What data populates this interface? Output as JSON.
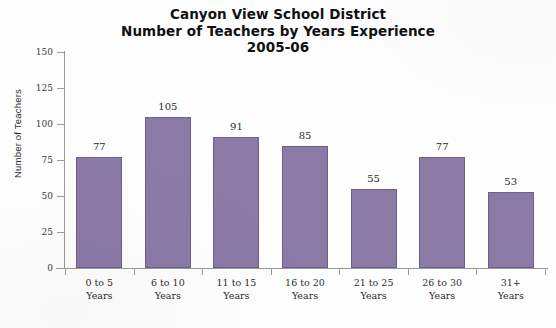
{
  "chart_data": {
    "type": "bar",
    "title": "Canyon View School District\nNumber of Teachers by Years Experience\n2005-06",
    "title_lines": [
      "Canyon View School District",
      "Number of Teachers by Years Experience",
      "2005-06"
    ],
    "categories": [
      "0 to 5 Years",
      "6 to 10 Years",
      "11 to 15 Years",
      "16 to 20 Years",
      "21 to 25 Years",
      "26 to 30 Years",
      "31+ Years"
    ],
    "category_lines": [
      [
        "0 to 5",
        "Years"
      ],
      [
        "6 to 10",
        "Years"
      ],
      [
        "11 to 15",
        "Years"
      ],
      [
        "16 to 20",
        "Years"
      ],
      [
        "21 to 25",
        "Years"
      ],
      [
        "26 to 30",
        "Years"
      ],
      [
        "31+",
        "Years"
      ]
    ],
    "values": [
      77,
      105,
      91,
      85,
      55,
      77,
      53
    ],
    "value_labels": [
      "77",
      "105",
      "91",
      "85",
      "55",
      "77",
      "53"
    ],
    "xlabel": "",
    "ylabel": "Number of Teachers",
    "ylim": [
      0,
      150
    ],
    "ytick_values": [
      0,
      25,
      50,
      75,
      100,
      125,
      150
    ],
    "ytick_labels": [
      "0",
      "25",
      "50",
      "75",
      "100",
      "125",
      "150"
    ],
    "grid": false,
    "legend": false,
    "bar_color": "#8b7aa6",
    "bar_border_color": "#6f5f8c",
    "axis_color": "#9a9a9a",
    "background_color": "#ffffff"
  }
}
